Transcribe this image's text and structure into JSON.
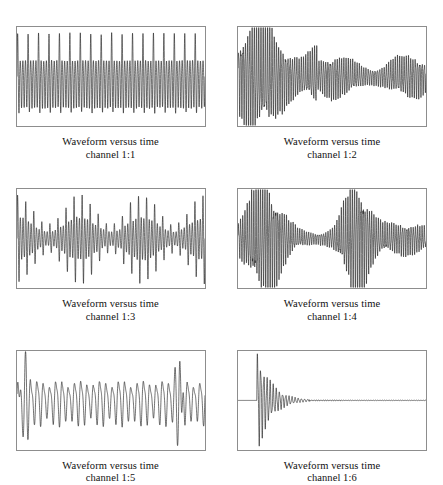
{
  "figure": {
    "name": "waveform-versus-time-panel-grid",
    "columns": 2,
    "rows": 3,
    "background_color": "#ffffff",
    "trace_color": "#1a1a1a",
    "frame_color": "#8d8d8d"
  },
  "panels": [
    {
      "id": "channel-1-1",
      "caption_line1": "Waveform versus time",
      "caption_line2": "channel 1:1",
      "description": "steady periodic waveform, alternating one tall peak followed by several short peaks, constant amplitude across the record"
    },
    {
      "id": "channel-1-2",
      "caption_line1": "Waveform versus time",
      "caption_line2": "channel 1:2",
      "description": "large amplitude burst at the start decaying into a sustained low amplitude oscillation for the remainder"
    },
    {
      "id": "channel-1-3",
      "caption_line1": "Waveform versus time",
      "caption_line2": "channel 1:3",
      "description": "amplitude modulated waveform, groups of tall peaks separated by quieter intervals"
    },
    {
      "id": "channel-1-4",
      "caption_line1": "Waveform versus time",
      "caption_line2": "channel 1:4",
      "description": "two high amplitude bursts separated by a quiet low amplitude interval, trailing off at the end"
    },
    {
      "id": "channel-1-5",
      "caption_line1": "Waveform versus time",
      "caption_line2": "channel 1:5",
      "description": "slow beating waveform with a sharp large spike at the beginning and another near the end"
    },
    {
      "id": "channel-1-6",
      "caption_line1": "Waveform versus time",
      "caption_line2": "channel 1:6",
      "description": "impulse response, flat baseline then a sharp transient that oscillates and decays rapidly back to the baseline"
    }
  ],
  "chart_data": [
    {
      "type": "line",
      "title": "Waveform versus time channel 1:1",
      "xlabel": "time",
      "ylabel": "amplitude",
      "xlim": [
        0,
        1
      ],
      "ylim": [
        -1,
        1
      ],
      "grid": false,
      "legend": "none",
      "series": [
        {
          "name": "channel 1:1",
          "model": "periodic_comb",
          "carrier_cycles": 72,
          "pattern_period": 4,
          "tall_peak_amplitude": 0.92,
          "short_peak_amplitude": 0.34,
          "trough_amplitude": -0.78,
          "envelope": "constant"
        }
      ]
    },
    {
      "type": "line",
      "title": "Waveform versus time channel 1:2",
      "xlabel": "time",
      "ylabel": "amplitude",
      "xlim": [
        0,
        1
      ],
      "ylim": [
        -1,
        1
      ],
      "grid": false,
      "legend": "none",
      "series": [
        {
          "name": "channel 1:2",
          "model": "decaying_burst",
          "carrier_cycles": 84,
          "burst_end_fraction": 0.42,
          "burst_peak_amplitude": 0.95,
          "tail_amplitude": 0.26,
          "envelope": "burst-then-steady-low"
        }
      ]
    },
    {
      "type": "line",
      "title": "Waveform versus time channel 1:3",
      "xlabel": "time",
      "ylabel": "amplitude",
      "xlim": [
        0,
        1
      ],
      "ylim": [
        -1,
        1
      ],
      "grid": false,
      "legend": "none",
      "series": [
        {
          "name": "channel 1:3",
          "model": "amplitude_modulated",
          "carrier_cycles": 70,
          "modulation_cycles": 3,
          "max_amplitude": 0.93,
          "min_amplitude": 0.3,
          "envelope": "slow sinusoidal modulation"
        }
      ]
    },
    {
      "type": "line",
      "title": "Waveform versus time channel 1:4",
      "xlabel": "time",
      "ylabel": "amplitude",
      "xlim": [
        0,
        1
      ],
      "ylim": [
        -1,
        1
      ],
      "grid": false,
      "legend": "none",
      "series": [
        {
          "name": "channel 1:4",
          "model": "double_burst",
          "carrier_cycles": 86,
          "burst1_center": 0.14,
          "burst2_center": 0.63,
          "burst_peak_amplitude": 0.95,
          "quiet_amplitude": 0.1,
          "envelope": "two gaussian bursts over a low floor"
        }
      ]
    },
    {
      "type": "line",
      "title": "Waveform versus time channel 1:5",
      "xlabel": "time",
      "ylabel": "amplitude",
      "xlim": [
        0,
        1
      ],
      "ylim": [
        -1,
        1
      ],
      "grid": false,
      "legend": "none",
      "series": [
        {
          "name": "channel 1:5",
          "model": "beating_with_spikes",
          "carrier_cycles": 30,
          "beat_cycles": 9,
          "base_amplitude": 0.45,
          "spike_amplitude": 0.95,
          "spike_positions": [
            0.04,
            0.86
          ],
          "envelope": "beat pattern with two sharp transients"
        }
      ]
    },
    {
      "type": "line",
      "title": "Waveform versus time channel 1:6",
      "xlabel": "time",
      "ylabel": "amplitude",
      "xlim": [
        0,
        1
      ],
      "ylim": [
        -1,
        1
      ],
      "grid": false,
      "legend": "none",
      "series": [
        {
          "name": "channel 1:6",
          "model": "impulse_response",
          "baseline_end_fraction": 0.1,
          "carrier_cycles": 60,
          "peak_amplitude": 0.98,
          "decay_rate": 14,
          "envelope": "exponentially damped transient returning to flat baseline"
        }
      ]
    }
  ]
}
